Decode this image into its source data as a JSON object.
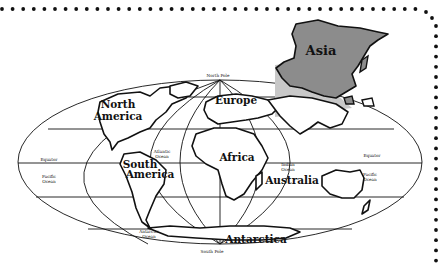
{
  "map": {
    "title": "World Map - Asia highlighted",
    "projection": "oval (Mollweide-style)",
    "highlighted_continent": "Asia",
    "continents": [
      {
        "name": "North America",
        "line1": "North",
        "line2": "America"
      },
      {
        "name": "South America",
        "line1": "South",
        "line2": "America"
      },
      {
        "name": "Europe",
        "line1": "Europe"
      },
      {
        "name": "Africa",
        "line1": "Africa"
      },
      {
        "name": "Australia",
        "line1": "Australia"
      },
      {
        "name": "Antarctica",
        "line1": "Antarctica"
      },
      {
        "name": "Asia",
        "line1": "Asia"
      }
    ],
    "oceans": [
      {
        "name": "Atlantic Ocean",
        "line1": "Atlantic",
        "line2": "Ocean"
      },
      {
        "name": "Pacific Ocean (west)",
        "line1": "Pacific",
        "line2": "Ocean"
      },
      {
        "name": "Pacific Ocean (east)",
        "line1": "Pacific",
        "line2": "Ocean"
      },
      {
        "name": "Indian Ocean",
        "line1": "Indian",
        "line2": "Ocean"
      },
      {
        "name": "Antarctic Ocean",
        "line1": "Antarctic",
        "line2": "Ocean"
      }
    ],
    "reference_lines": {
      "north_pole": "North Pole",
      "south_pole": "South Pole",
      "equator_left": "Equator",
      "equator_right": "Equator"
    },
    "colors": {
      "outline": "#111111",
      "asia_fill": "#8c8c8c",
      "wedge_fill": "#c8c8c8",
      "border_dots": "#111111",
      "background": "#ffffff"
    }
  }
}
